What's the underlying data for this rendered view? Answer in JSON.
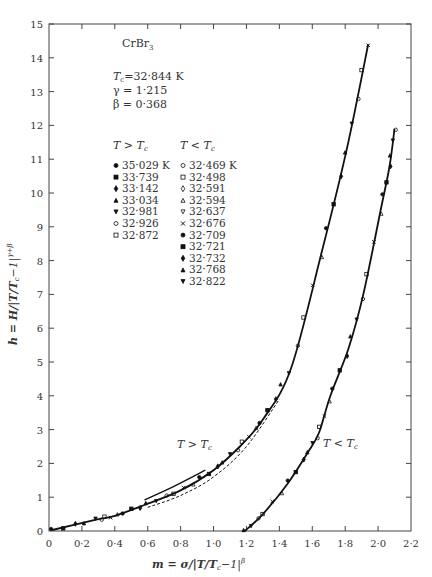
{
  "chart_data": {
    "type": "scatter",
    "title": "CrBr3",
    "parameters": {
      "Tc": "32·844 K",
      "gamma": "1·215",
      "beta": "0·368"
    },
    "xlabel": "m = σ/|T/Tc−1|^β",
    "ylabel": "h = H/|T/Tc−1|^(γ+β)",
    "xlim": [
      0,
      2.2
    ],
    "ylim": [
      0,
      15
    ],
    "xticks": [
      "0",
      "0·2",
      "0·4",
      "0·6",
      "0·8",
      "1·0",
      "1·2",
      "1·4",
      "1·6",
      "1·8",
      "2·0",
      "2·2"
    ],
    "yticks": [
      "0",
      "1",
      "2",
      "3",
      "4",
      "5",
      "6",
      "7",
      "8",
      "9",
      "10",
      "11",
      "12",
      "13",
      "14",
      "15"
    ],
    "grid": false,
    "legend_position": "upper-left",
    "legend": {
      "above_header": "T > Tc",
      "above": [
        {
          "marker": "filled-circle",
          "label": "35·029  K"
        },
        {
          "marker": "filled-square",
          "label": "33·739"
        },
        {
          "marker": "filled-diamond",
          "label": "33·142"
        },
        {
          "marker": "filled-triangle-up",
          "label": "33·034"
        },
        {
          "marker": "filled-triangle-down",
          "label": "32·981"
        },
        {
          "marker": "open-circle",
          "label": "32·926"
        },
        {
          "marker": "open-square",
          "label": "32·872"
        }
      ],
      "below_header": "T < Tc",
      "below": [
        {
          "marker": "open-circle",
          "label": "32·469  K"
        },
        {
          "marker": "open-square",
          "label": "32·498"
        },
        {
          "marker": "open-diamond",
          "label": "32·591"
        },
        {
          "marker": "open-triangle-up",
          "label": "32·594"
        },
        {
          "marker": "open-triangle-down",
          "label": "32·637"
        },
        {
          "marker": "cross",
          "label": "32·676"
        },
        {
          "marker": "filled-circle",
          "label": "32·709"
        },
        {
          "marker": "filled-square",
          "label": "32·721"
        },
        {
          "marker": "filled-diamond",
          "label": "32·732"
        },
        {
          "marker": "filled-triangle-up",
          "label": "32·768"
        },
        {
          "marker": "filled-triangle-down",
          "label": "32·822"
        }
      ]
    },
    "annotations": [
      "T > Tc",
      "T < Tc"
    ],
    "series": [
      {
        "name": "T > Tc (fit curve)",
        "x": [
          0.02,
          0.28,
          0.4,
          0.58,
          0.8,
          1.0,
          1.16,
          1.3,
          1.47,
          1.66,
          1.81,
          1.94
        ],
        "y": [
          0.03,
          0.33,
          0.45,
          0.77,
          1.2,
          1.8,
          2.5,
          3.3,
          4.8,
          8.3,
          11.3,
          14.4
        ]
      },
      {
        "name": "T < Tc (fit curve)",
        "x": [
          1.19,
          1.3,
          1.45,
          1.57,
          1.64,
          1.71,
          1.82,
          1.91,
          2.02,
          2.07,
          2.1
        ],
        "y": [
          0.0,
          0.5,
          1.4,
          2.3,
          2.9,
          4.0,
          5.4,
          7.0,
          9.6,
          10.8,
          11.9
        ]
      },
      {
        "name": "T > Tc (short solid line)",
        "x": [
          0.58,
          0.75,
          0.95
        ],
        "y": [
          0.92,
          1.3,
          1.8
        ]
      },
      {
        "name": "T > Tc (dashed line)",
        "x": [
          0.6,
          0.8,
          1.0,
          1.2,
          1.4
        ],
        "y": [
          0.7,
          1.05,
          1.6,
          2.5,
          3.9
        ]
      }
    ]
  },
  "labels": {
    "compound": "CrBr",
    "compound_sub": "3",
    "tc_line": "T",
    "tc_sub": "c",
    "tc_value": "=32·844  K",
    "gamma_line": "γ =  1·215",
    "beta_line": "β =  0·368",
    "hdr_above": "T > T",
    "hdr_below": "T < T",
    "hdr_sub": "c",
    "annot_above": "T > T",
    "annot_below": "T < T",
    "annot_sub": "c",
    "xlabel_main": "m = σ/|T/T",
    "xlabel_sub": "c",
    "xlabel_tail": "−1|",
    "xlabel_sup": "β",
    "ylabel_main": "h = H/|T/T",
    "ylabel_sub": "c",
    "ylabel_tail": "−1|",
    "ylabel_sup": "γ+β"
  },
  "colors": {
    "ink": "#222222",
    "axis": "#444444",
    "background": "#ffffff"
  }
}
